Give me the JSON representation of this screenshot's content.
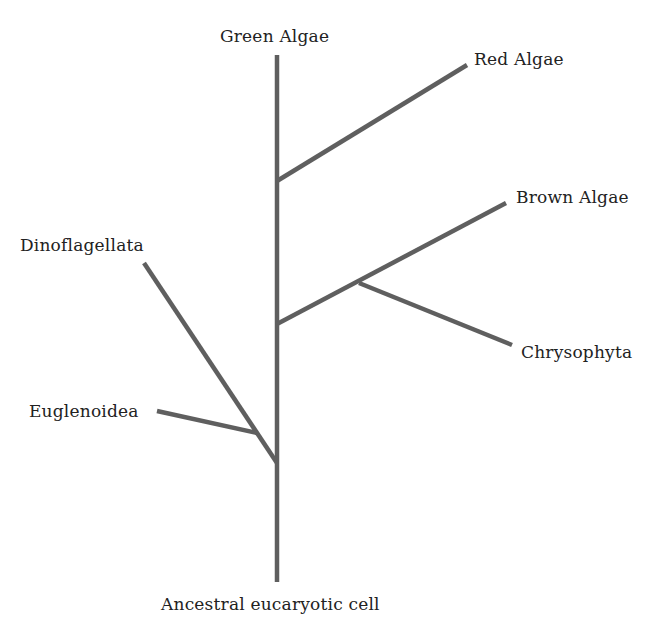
{
  "diagram": {
    "type": "phylogenetic-tree",
    "root_label": "Ancestral eucaryotic cell",
    "taxa": {
      "green_algae": "Green Algae",
      "red_algae": "Red Algae",
      "brown_algae": "Brown Algae",
      "chrysophyta": "Chrysophyta",
      "dinoflagellata": "Dinoflagellata",
      "euglenoidea": "Euglenoidea"
    },
    "colors": {
      "branch": "#5f5f5f",
      "text": "#222222",
      "background": "#ffffff"
    },
    "structure": {
      "root": "Ancestral eucaryotic cell",
      "trunk_tip": "Green Algae",
      "branches_from_trunk_bottom_to_top": [
        {
          "clade": [
            "Dinoflagellata",
            "Euglenoidea"
          ],
          "side": "left"
        },
        {
          "clade": [
            "Brown Algae",
            "Chrysophyta"
          ],
          "side": "right"
        },
        {
          "clade": [
            "Red Algae"
          ],
          "side": "right"
        }
      ]
    }
  }
}
